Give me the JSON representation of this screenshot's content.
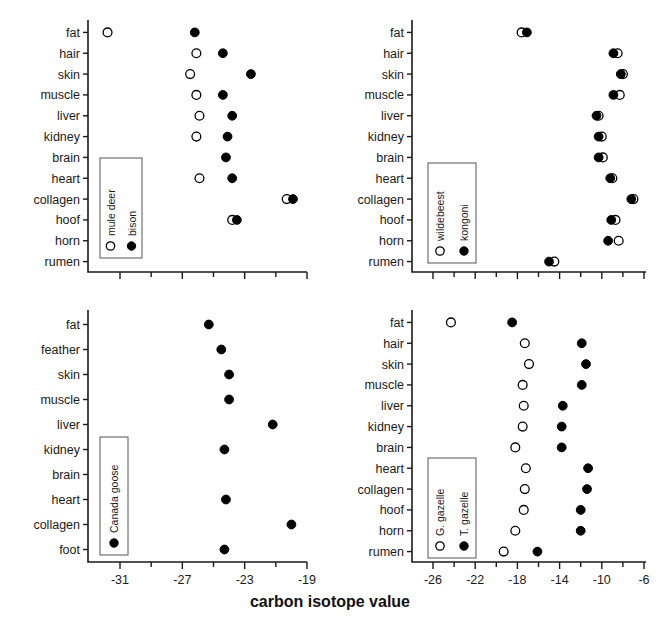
{
  "figure": {
    "axis_title": "carbon isotope value",
    "background": "#ffffff",
    "marker_color": "#000000",
    "axis_color": "#1a1a1a"
  },
  "chart_data": [
    {
      "type": "scatter",
      "panel": "top-left",
      "title": "",
      "xlabel": "carbon isotope value",
      "ylabel": "",
      "xlim": [
        -31.9,
        -17.9
      ],
      "xticks": [
        -31,
        -27,
        -23,
        -19
      ],
      "xtick_labels": [
        "-31",
        "-27",
        "-23",
        "-19"
      ],
      "minor_xticks": [
        -29,
        -25,
        -21
      ],
      "grid": false,
      "categories": [
        "fat",
        "hair",
        "skin",
        "muscle",
        "liver",
        "kidney",
        "brain",
        "heart",
        "collagen",
        "hoof",
        "horn",
        "rumen"
      ],
      "legend_position": "inside-left",
      "series": [
        {
          "name": "mule deer",
          "marker": "open-circle",
          "values": [
            -31.8,
            -26.1,
            -26.5,
            -26.1,
            -25.9,
            -26.1,
            null,
            -25.9,
            -20.3,
            -23.8,
            null,
            null
          ]
        },
        {
          "name": "bison",
          "marker": "filled-circle",
          "values": [
            -26.2,
            -24.4,
            -22.6,
            -24.4,
            -23.8,
            -24.1,
            -24.2,
            -23.8,
            -19.9,
            -23.5,
            null,
            null
          ]
        }
      ]
    },
    {
      "type": "scatter",
      "panel": "top-right",
      "title": "",
      "xlabel": "carbon isotope value",
      "ylabel": "",
      "xlim": [
        -28.0,
        -5.2
      ],
      "xticks": [
        -26,
        -22,
        -18,
        -14,
        -10,
        -6
      ],
      "xtick_labels": [
        "-26",
        "-22",
        "-18",
        "-14",
        "-10",
        "-6"
      ],
      "minor_xticks": [
        -24,
        -20,
        -16,
        -12,
        -8
      ],
      "grid": false,
      "categories": [
        "fat",
        "hair",
        "skin",
        "muscle",
        "liver",
        "kidney",
        "brain",
        "heart",
        "collagen",
        "hoof",
        "horn",
        "rumen"
      ],
      "legend_position": "inside-left",
      "series": [
        {
          "name": "wildebeest",
          "marker": "open-circle",
          "values": [
            -17.6,
            -8.5,
            -8.0,
            -8.3,
            -10.3,
            -10.0,
            -9.9,
            -9.0,
            -7.0,
            -8.7,
            -8.4,
            -14.5
          ]
        },
        {
          "name": "kongoni",
          "marker": "filled-circle",
          "values": [
            -17.1,
            -8.9,
            -8.2,
            -8.9,
            -10.5,
            -10.3,
            -10.3,
            -9.2,
            -7.2,
            -9.1,
            -9.4,
            -15.0
          ]
        }
      ]
    },
    {
      "type": "scatter",
      "panel": "bottom-left",
      "title": "",
      "xlabel": "carbon isotope value",
      "ylabel": "",
      "xlim": [
        -31.9,
        -17.9
      ],
      "xticks": [
        -31,
        -27,
        -23,
        -19
      ],
      "xtick_labels": [
        "-31",
        "-27",
        "-23",
        "-19"
      ],
      "minor_xticks": [
        -29,
        -25,
        -21
      ],
      "grid": false,
      "categories": [
        "fat",
        "feather",
        "skin",
        "muscle",
        "liver",
        "kidney",
        "brain",
        "heart",
        "collagen",
        "foot"
      ],
      "legend_position": "inside-left",
      "series": [
        {
          "name": "Canada goose",
          "marker": "filled-circle",
          "values": [
            -25.3,
            -24.5,
            -24.0,
            -24.0,
            -21.2,
            -24.3,
            null,
            -24.2,
            -20.0,
            -24.3
          ]
        }
      ]
    },
    {
      "type": "scatter",
      "panel": "bottom-right",
      "title": "",
      "xlabel": "carbon isotope value",
      "ylabel": "",
      "xlim": [
        -28.0,
        -5.2
      ],
      "xticks": [
        -26,
        -22,
        -18,
        -14,
        -10,
        -6
      ],
      "xtick_labels": [
        "-26",
        "-22",
        "-18",
        "-14",
        "-10",
        "-6"
      ],
      "minor_xticks": [
        -24,
        -20,
        -16,
        -12,
        -8
      ],
      "grid": false,
      "categories": [
        "fat",
        "hair",
        "skin",
        "muscle",
        "liver",
        "kidney",
        "brain",
        "heart",
        "collagen",
        "hoof",
        "horn",
        "rumen"
      ],
      "legend_position": "inside-left",
      "series": [
        {
          "name": "G. gazelle",
          "marker": "open-circle",
          "values": [
            -24.3,
            -17.3,
            -16.9,
            -17.5,
            -17.4,
            -17.5,
            -18.2,
            -17.2,
            -17.3,
            -17.4,
            -18.2,
            -19.3
          ]
        },
        {
          "name": "T. gazelle",
          "marker": "filled-circle",
          "values": [
            -18.5,
            -11.9,
            -11.5,
            -11.9,
            -13.7,
            -13.8,
            -13.8,
            -11.3,
            -11.4,
            -12.0,
            -12.0,
            -16.1
          ]
        }
      ]
    }
  ]
}
